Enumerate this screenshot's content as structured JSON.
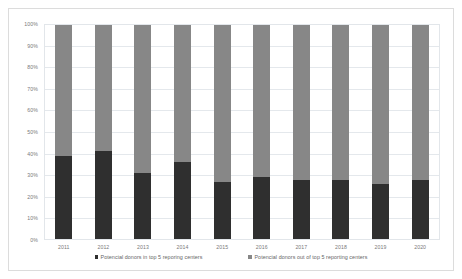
{
  "chart_data": {
    "type": "bar",
    "subtype": "stacked-100-percent",
    "title": "",
    "xlabel": "",
    "ylabel": "",
    "ylim": [
      0,
      100
    ],
    "yunit": "%",
    "grid": true,
    "legend_position": "bottom",
    "categories": [
      "2011",
      "2012",
      "2013",
      "2014",
      "2015",
      "2016",
      "2017",
      "2018",
      "2019",
      "2020"
    ],
    "ytick_labels": [
      "100%",
      "90%",
      "80%",
      "70%",
      "60%",
      "50%",
      "40%",
      "30%",
      "20%",
      "10%",
      "0%"
    ],
    "ytick_values": [
      100,
      90,
      80,
      70,
      60,
      50,
      40,
      30,
      20,
      10,
      0
    ],
    "series": [
      {
        "name": "Potencial donors in top 5 reporing centers",
        "color": "#2f2f2f",
        "values": [
          39,
          41,
          31,
          36,
          27,
          29,
          28,
          28,
          26,
          28
        ]
      },
      {
        "name": "Potencial donors out of top 5 reporting centers",
        "color": "#878787",
        "values": [
          61,
          59,
          69,
          64,
          73,
          71,
          72,
          72,
          74,
          72
        ]
      }
    ]
  },
  "legend": {
    "items": [
      {
        "label": "Potencial donors in top 5 reporing centers"
      },
      {
        "label": "Potencial donors out of top 5 reporting centers"
      }
    ]
  },
  "colors": {
    "series_dark": "#2f2f2f",
    "series_gray": "#878787",
    "gridline": "#e4e8ec",
    "frame_border": "#dcdcdc",
    "axis_text": "#7a7a7a",
    "legend_text": "#666666"
  }
}
